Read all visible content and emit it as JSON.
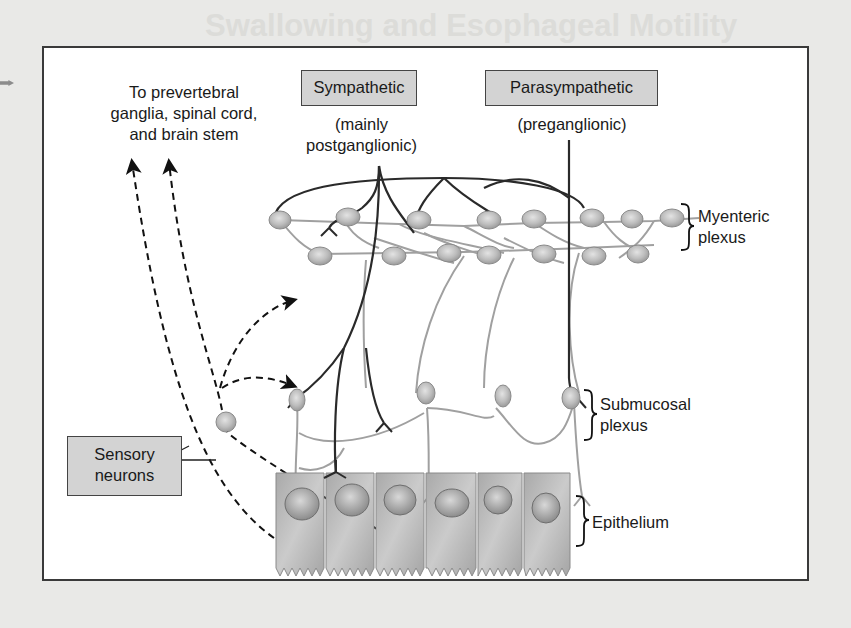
{
  "background_page": {
    "heading": "Swallowing and Esophageal Motility"
  },
  "figure": {
    "top_left_label": {
      "lines": [
        "To prevertebral",
        "ganglia, spinal cord,",
        "and brain stem"
      ]
    },
    "sympathetic": {
      "box_label": "Sympathetic",
      "sub_lines": [
        "(mainly",
        "postganglionic)"
      ]
    },
    "parasympathetic": {
      "box_label": "Parasympathetic",
      "sub_lines": [
        "(preganglionic)"
      ]
    },
    "sensory": {
      "box_lines": [
        "Sensory",
        "neurons"
      ]
    },
    "layers": [
      {
        "name": "myenteric",
        "lines": [
          "Myenteric",
          "plexus"
        ]
      },
      {
        "name": "submucosal",
        "lines": [
          "Submucosal",
          "plexus"
        ]
      },
      {
        "name": "epithelium",
        "lines": [
          "Epithelium"
        ]
      }
    ],
    "colors": {
      "label_box_fill": "#d3d3d3",
      "neuron_fill": "#bdbdbd",
      "enteric_fiber": "#9a9a9a",
      "autonomic_fiber": "#2a2a2a",
      "epithelium_fill": "#b9b9b9"
    }
  }
}
